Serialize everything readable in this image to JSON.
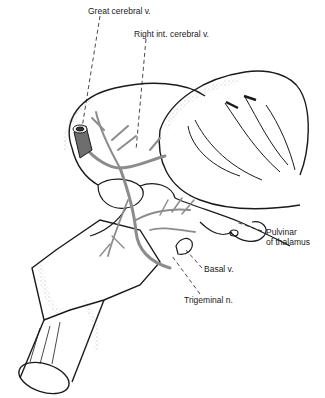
{
  "figure": {
    "colors": {
      "line": "#1a1a1a",
      "vein": "#8c8c8c",
      "stipple": "#555555",
      "background": "#ffffff"
    }
  },
  "labels": {
    "great_cerebral": "Great cerebral v.",
    "right_int_cerebral": "Right int. cerebral v.",
    "pulvinar_line1": "Pulvinar",
    "pulvinar_line2": "of thalamus",
    "basal": "Basal v.",
    "trigeminal": "Trigeminal n."
  }
}
